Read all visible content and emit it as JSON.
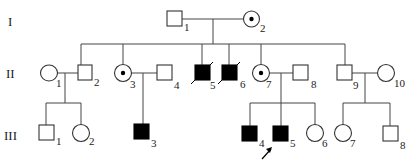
{
  "generations": [
    {
      "label": "I"
    },
    {
      "label": "II"
    },
    {
      "label": "III"
    }
  ],
  "individuals": {
    "I-1": {
      "id": "1",
      "sex": "male",
      "status": "unaffected"
    },
    "I-2": {
      "id": "2",
      "sex": "female",
      "status": "carrier"
    },
    "II-1": {
      "id": "1",
      "sex": "female",
      "status": "unaffected"
    },
    "II-2": {
      "id": "2",
      "sex": "male",
      "status": "unaffected"
    },
    "II-3": {
      "id": "3",
      "sex": "female",
      "status": "carrier"
    },
    "II-4": {
      "id": "4",
      "sex": "male",
      "status": "unaffected"
    },
    "II-5": {
      "id": "5",
      "sex": "male",
      "status": "affected",
      "deceased": true
    },
    "II-6": {
      "id": "6",
      "sex": "male",
      "status": "affected",
      "deceased": true
    },
    "II-7": {
      "id": "7",
      "sex": "female",
      "status": "carrier"
    },
    "II-8": {
      "id": "8",
      "sex": "male",
      "status": "unaffected"
    },
    "II-9": {
      "id": "9",
      "sex": "male",
      "status": "unaffected"
    },
    "II-10": {
      "id": "10",
      "sex": "female",
      "status": "unaffected"
    },
    "III-1": {
      "id": "1",
      "sex": "male",
      "status": "unaffected"
    },
    "III-2": {
      "id": "2",
      "sex": "female",
      "status": "unaffected"
    },
    "III-3": {
      "id": "3",
      "sex": "male",
      "status": "affected"
    },
    "III-4": {
      "id": "4",
      "sex": "male",
      "status": "affected"
    },
    "III-5": {
      "id": "5",
      "sex": "male",
      "status": "affected",
      "proband": true
    },
    "III-6": {
      "id": "6",
      "sex": "female",
      "status": "unaffected"
    },
    "III-7": {
      "id": "7",
      "sex": "female",
      "status": "unaffected"
    },
    "III-8": {
      "id": "8",
      "sex": "male",
      "status": "unaffected"
    }
  },
  "colors": {
    "affected": "#000000",
    "line": "#444444",
    "background": "#ffffff"
  }
}
